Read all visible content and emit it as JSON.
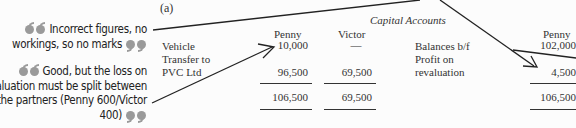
{
  "part_label": "(a)",
  "table_title": "Capital Accounts",
  "comments": [
    {
      "text_lines": [
        "Incorrect figures, no",
        "workings, so no marks"
      ]
    },
    {
      "text_lines": [
        "Good, but the loss on",
        "valuation must be split between",
        "the partners (Penny 600/Victor",
        "400)"
      ]
    }
  ],
  "debit_side": {
    "columns": [
      "Penny",
      "Victor"
    ],
    "rows": [
      {
        "label": "Vehicle Transfer to PVC Ltd",
        "label_lines": [
          "Vehicle",
          "Transfer to",
          "PVC Ltd"
        ],
        "penny": "10,000",
        "victor": "—"
      },
      {
        "label": "",
        "penny": "96,500",
        "victor": "69,500"
      }
    ],
    "totals": {
      "penny": "106,500",
      "victor": "69,500"
    }
  },
  "credit_side": {
    "columns": [
      "Penny"
    ],
    "rows": [
      {
        "label": "Balances b/f",
        "penny": "102,000"
      },
      {
        "label": "Profit on revaluation",
        "label_lines": [
          "Profit on",
          "revaluation"
        ],
        "penny": "4,500"
      }
    ],
    "totals": {
      "penny": "106,500"
    }
  }
}
